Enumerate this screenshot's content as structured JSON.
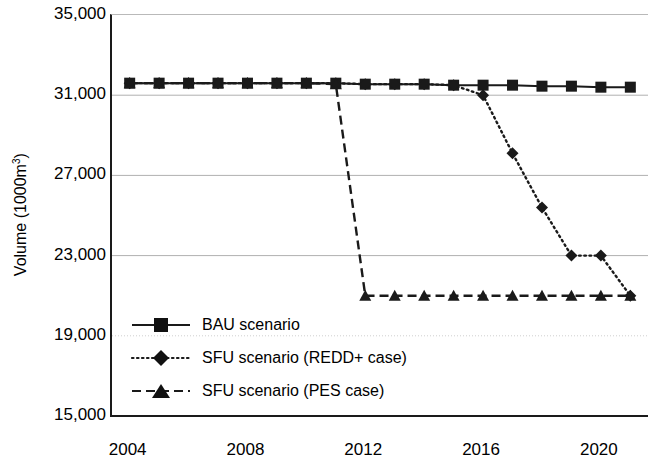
{
  "chart_data": {
    "type": "line",
    "title": "",
    "xlabel": "",
    "ylabel": "Volume (1000m3)",
    "ylabel_prefix": "Volume (1000m",
    "ylabel_sup": "3",
    "ylabel_suffix": ")",
    "x": [
      2004,
      2005,
      2006,
      2007,
      2008,
      2009,
      2010,
      2011,
      2012,
      2013,
      2014,
      2015,
      2016,
      2017,
      2018,
      2019,
      2020,
      2021
    ],
    "xlim": [
      2003.4,
      2021.6
    ],
    "ylim": [
      15000,
      35000
    ],
    "yticks": [
      35000,
      31000,
      27000,
      23000,
      19000,
      15000
    ],
    "ytick_labels": [
      "35,000",
      "31,000",
      "27,000",
      "23,000",
      "19,000",
      "15,000"
    ],
    "xticks": [
      2004,
      2008,
      2012,
      2016,
      2020
    ],
    "xtick_labels": [
      "2004",
      "2008",
      "2012",
      "2016",
      "2020"
    ],
    "grid": true,
    "legend_position": "inside-lower-left",
    "series": [
      {
        "name": "BAU scenario",
        "style": "solid",
        "marker": "square",
        "color": "#1a1a1a",
        "values": [
          31600,
          31600,
          31600,
          31600,
          31600,
          31600,
          31600,
          31600,
          31550,
          31550,
          31550,
          31500,
          31500,
          31500,
          31450,
          31450,
          31400,
          31400
        ]
      },
      {
        "name": "SFU scenario (REDD+ case)",
        "style": "dotted",
        "marker": "diamond",
        "color": "#1a1a1a",
        "values": [
          31600,
          31600,
          31600,
          31600,
          31600,
          31600,
          31600,
          31600,
          31550,
          31550,
          31550,
          31500,
          31000,
          28100,
          25400,
          23000,
          23000,
          21000
        ],
        "note": "Overlaps BAU line until 2016, then declines; 2019 and 2020 markers near 23,000"
      },
      {
        "name": "SFU scenario (PES case)",
        "style": "dashed",
        "marker": "triangle",
        "color": "#1a1a1a",
        "values": [
          31600,
          31600,
          31600,
          31600,
          31600,
          31600,
          31600,
          31550,
          21000,
          21000,
          21000,
          21000,
          21000,
          21000,
          21000,
          21000,
          21000,
          21000
        ],
        "note": "Overlaps BAU until 2011, drops sharply to ~21,000 by 2012 and stays flat"
      }
    ]
  },
  "legend": {
    "items": [
      {
        "label": "BAU scenario",
        "key": "solid-square-key"
      },
      {
        "label": "SFU scenario (REDD+ case)",
        "key": "dotted-diamond-key"
      },
      {
        "label": "SFU scenario (PES case)",
        "key": "dashed-triangle-key"
      }
    ]
  }
}
